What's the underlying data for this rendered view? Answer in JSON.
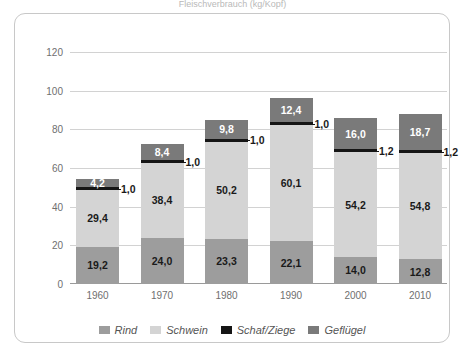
{
  "title_strip": "Fleischverbrauch (kg/Kopf)",
  "chart_data": {
    "type": "bar",
    "stacked": true,
    "title": "",
    "xlabel": "",
    "ylabel": "",
    "ylim": [
      0,
      120
    ],
    "ytick_step": 20,
    "grid": true,
    "legend_position": "bottom",
    "categories": [
      "1960",
      "1970",
      "1980",
      "1990",
      "2000",
      "2010"
    ],
    "yticks": [
      "0",
      "20",
      "40",
      "60",
      "80",
      "100",
      "120"
    ],
    "series": [
      {
        "name": "Rind",
        "color": "#9d9d9d",
        "values": [
          19.2,
          24.0,
          23.3,
          22.1,
          14.0,
          12.8
        ],
        "labels": [
          "19,2",
          "24,0",
          "23,3",
          "22,1",
          "14,0",
          "12,8"
        ]
      },
      {
        "name": "Schwein",
        "color": "#d4d4d4",
        "values": [
          29.4,
          38.4,
          50.2,
          60.1,
          54.2,
          54.8
        ],
        "labels": [
          "29,4",
          "38,4",
          "50,2",
          "60,1",
          "54,2",
          "54,8"
        ]
      },
      {
        "name": "Schaf/Ziege",
        "color": "#151515",
        "values": [
          1.0,
          1.0,
          1.0,
          1.0,
          1.2,
          1.2
        ],
        "labels": [
          "1,0",
          "1,0",
          "1,0",
          "1,0",
          "1,2",
          "1,2"
        ]
      },
      {
        "name": "Geflügel",
        "color": "#7a7a7a",
        "values": [
          4.2,
          8.4,
          9.8,
          12.4,
          16.0,
          18.7
        ],
        "labels": [
          "4,2",
          "8,4",
          "9,8",
          "12,4",
          "16,0",
          "18,7"
        ]
      }
    ],
    "totals": [
      53.8,
      71.8,
      84.3,
      95.6,
      85.4,
      87.5
    ]
  },
  "legend": {
    "items": [
      {
        "label": "Rind",
        "color": "#9d9d9d"
      },
      {
        "label": "Schwein",
        "color": "#d4d4d4"
      },
      {
        "label": "Schaf/Ziege",
        "color": "#151515"
      },
      {
        "label": "Geflügel",
        "color": "#7a7a7a"
      }
    ]
  }
}
